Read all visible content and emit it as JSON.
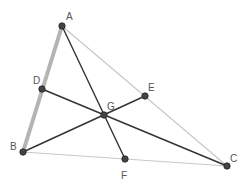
{
  "diagram": {
    "type": "triangle-medians",
    "points": {
      "A": {
        "x": 62,
        "y": 26,
        "label": "A",
        "lx": 66,
        "ly": 20
      },
      "B": {
        "x": 23,
        "y": 152,
        "label": "B",
        "lx": 10,
        "ly": 150
      },
      "C": {
        "x": 227,
        "y": 166,
        "label": "C",
        "lx": 230,
        "ly": 162
      },
      "D": {
        "x": 42,
        "y": 89,
        "label": "D",
        "lx": 33,
        "ly": 84
      },
      "E": {
        "x": 145,
        "y": 96,
        "label": "E",
        "lx": 148,
        "ly": 91
      },
      "F": {
        "x": 125,
        "y": 159,
        "label": "F",
        "lx": 121,
        "ly": 179
      },
      "G": {
        "x": 104,
        "y": 115,
        "label": "G",
        "lx": 107,
        "ly": 110
      }
    },
    "colors": {
      "side_light": "#c8c8c8",
      "side_highlight": "#b4b4b4",
      "median": "#333333",
      "point_fill": "#444444",
      "point_stroke": "#222222",
      "label": "#555555"
    }
  }
}
